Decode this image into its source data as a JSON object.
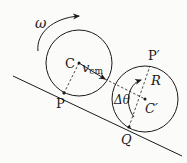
{
  "diagram": {
    "labels": {
      "omega": "ω",
      "center_initial": "C",
      "velocity": "v",
      "velocity_sub": "cm",
      "contact_initial": "P",
      "top_point": "P′",
      "radius": "R",
      "angle": "Δθ",
      "center_final": "C′",
      "contact_final": "Q"
    },
    "colors": {
      "stroke": "#1a1a1a",
      "background": "#fbfbfa"
    }
  }
}
